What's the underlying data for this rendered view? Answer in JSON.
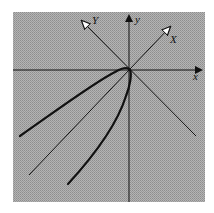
{
  "figure": {
    "background_color": "#a9a9a9",
    "line_color": "#111111",
    "labels": {
      "x_axis": "x",
      "y_axis": "y",
      "rotated_x_axis": "X",
      "rotated_y_axis": "Y"
    }
  }
}
